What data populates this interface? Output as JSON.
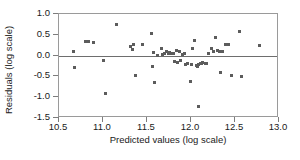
{
  "chart_data": {
    "type": "scatter",
    "title": "",
    "xlabel": "Predicted values (log scale)",
    "ylabel": "Residuals (log scale)",
    "xlim": [
      10.5,
      13.0
    ],
    "ylim": [
      -1.5,
      1.0
    ],
    "xticks": [
      "10.5",
      "11.0",
      "11.5",
      "12.0",
      "12.5",
      "13.0"
    ],
    "xtick_values": [
      10.5,
      11.0,
      11.5,
      12.0,
      12.5,
      13.0
    ],
    "yticks": [
      "1.0",
      "0.5",
      "0.0",
      "-0.5",
      "-1.0",
      "-1.5"
    ],
    "ytick_values": [
      1.0,
      0.5,
      0.0,
      -0.5,
      -1.0,
      -1.5
    ],
    "grid": false,
    "legend": null,
    "reference_lines": [
      {
        "axis": "y",
        "value": 0.0,
        "color": "#6e6e6e"
      }
    ],
    "marker": {
      "shape": "square",
      "color": "#5c5c5c",
      "size": 3
    },
    "point_count": 62,
    "points": [
      [
        10.66,
        0.1
      ],
      [
        10.67,
        -0.29
      ],
      [
        10.8,
        0.34
      ],
      [
        10.84,
        0.33
      ],
      [
        10.89,
        0.32
      ],
      [
        11.01,
        -0.12
      ],
      [
        11.03,
        -0.92
      ],
      [
        11.15,
        0.74
      ],
      [
        11.31,
        0.21
      ],
      [
        11.33,
        0.15
      ],
      [
        11.35,
        0.27
      ],
      [
        11.37,
        -0.47
      ],
      [
        11.45,
        0.26
      ],
      [
        11.55,
        0.53
      ],
      [
        11.56,
        -0.26
      ],
      [
        11.57,
        0.07
      ],
      [
        11.58,
        -0.65
      ],
      [
        11.62,
        0.0
      ],
      [
        11.66,
        0.18
      ],
      [
        11.7,
        0.06
      ],
      [
        11.72,
        0.09
      ],
      [
        11.74,
        0.05
      ],
      [
        11.76,
        0.07
      ],
      [
        11.78,
        0.06
      ],
      [
        11.8,
        0.04
      ],
      [
        11.81,
        -0.14
      ],
      [
        11.83,
        0.13
      ],
      [
        11.85,
        -0.16
      ],
      [
        11.87,
        0.1
      ],
      [
        11.9,
        0.02
      ],
      [
        11.92,
        0.06
      ],
      [
        11.94,
        -0.21
      ],
      [
        11.96,
        -0.2
      ],
      [
        11.99,
        -0.63
      ],
      [
        12.0,
        -0.22
      ],
      [
        12.02,
        0.17
      ],
      [
        12.04,
        0.36
      ],
      [
        12.06,
        -0.23
      ],
      [
        12.07,
        -0.25
      ],
      [
        12.08,
        -1.22
      ],
      [
        12.09,
        -0.22
      ],
      [
        12.11,
        -0.19
      ],
      [
        12.12,
        -0.2
      ],
      [
        12.13,
        -0.17
      ],
      [
        12.16,
        -0.2
      ],
      [
        12.2,
        0.05
      ],
      [
        12.23,
        0.16
      ],
      [
        12.26,
        0.11
      ],
      [
        12.28,
        0.44
      ],
      [
        12.3,
        0.13
      ],
      [
        12.32,
        0.11
      ],
      [
        12.33,
        -0.4
      ],
      [
        12.36,
        0.11
      ],
      [
        12.39,
        0.28
      ],
      [
        12.42,
        0.27
      ],
      [
        12.46,
        -0.48
      ],
      [
        12.55,
        0.59
      ],
      [
        12.57,
        -0.5
      ],
      [
        12.78,
        0.25
      ],
      [
        11.68,
        0.02
      ],
      [
        11.88,
        -0.12
      ],
      [
        12.18,
        -0.18
      ]
    ]
  }
}
